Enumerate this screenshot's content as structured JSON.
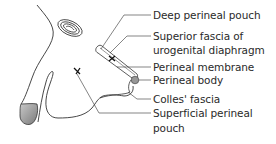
{
  "diagram": {
    "labels": [
      {
        "id": "deep-perineal-pouch",
        "lines": [
          "Deep perineal pouch"
        ]
      },
      {
        "id": "superior-fascia",
        "lines": [
          "Superior fascia of",
          "urogenital diaphragm"
        ]
      },
      {
        "id": "perineal-membrane",
        "lines": [
          "Perineal membrane"
        ]
      },
      {
        "id": "perineal-body",
        "lines": [
          "Perineal body"
        ]
      },
      {
        "id": "colles-fascia",
        "lines": [
          "Colles' fascia"
        ]
      },
      {
        "id": "superficial-perineal-pouch",
        "lines": [
          "Superficial perineal",
          "pouch"
        ]
      }
    ],
    "markers": [
      "x-mark-deep-pouch",
      "x-mark-superficial-pouch"
    ],
    "colors": {
      "line": "#333333",
      "glans_fill": "#9a9a9a",
      "text": "#2a2a2a"
    }
  }
}
